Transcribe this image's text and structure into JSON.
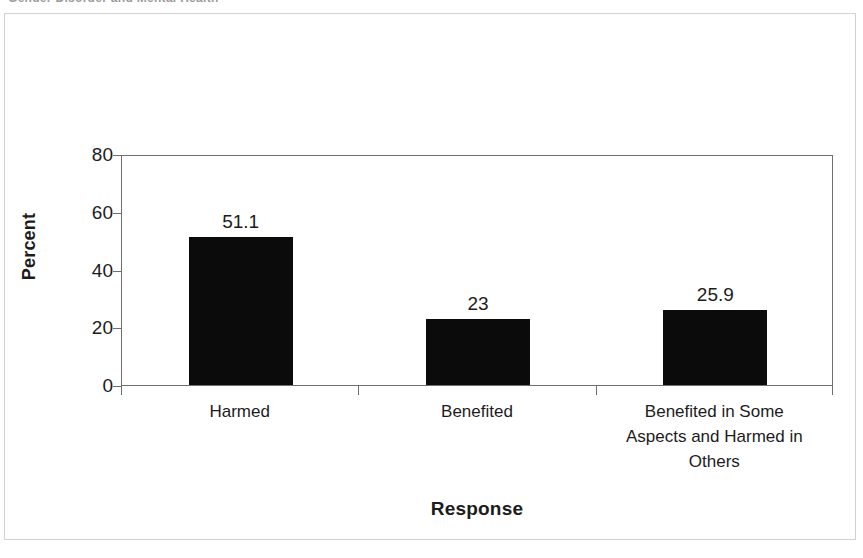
{
  "clipped_header": {
    "text": "Gender Disorder and Mental Health"
  },
  "chart_data": {
    "type": "bar",
    "title": "",
    "subtitle": "",
    "xlabel": "Response",
    "ylabel": "Percent",
    "categories": [
      "Harmed",
      "Benefited",
      "Benefited in Some Aspects and Harmed in Others"
    ],
    "category_lines": [
      [
        "Harmed"
      ],
      [
        "Benefited"
      ],
      [
        "Benefited in Some",
        "Aspects and Harmed in",
        "Others"
      ]
    ],
    "values": [
      51.1,
      23,
      25.9
    ],
    "value_labels": [
      "51.1",
      "23",
      "25.9"
    ],
    "ylim": [
      0,
      80
    ],
    "yticks": [
      0,
      20,
      40,
      60,
      80
    ],
    "ytick_labels": [
      "0",
      "20",
      "40",
      "60",
      "80"
    ],
    "grid": false,
    "legend": false,
    "legend_position": "none",
    "bar_color": "#0b0b0b",
    "axis_color": "#6e6e6e",
    "text_color": "#1c1c1c",
    "background_color": "#ffffff"
  }
}
